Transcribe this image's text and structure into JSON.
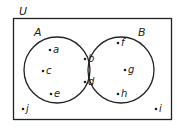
{
  "diagram": {
    "type": "venn",
    "universe_label": "U",
    "sets": [
      {
        "label": "A",
        "elements_only": [
          "a",
          "c",
          "e"
        ]
      },
      {
        "label": "B",
        "elements_only": [
          "f",
          "g",
          "h"
        ]
      }
    ],
    "intersection": [
      "b",
      "d"
    ],
    "outside": [
      "j",
      "i"
    ],
    "points": [
      {
        "label": "a",
        "x": 50,
        "y": 50
      },
      {
        "label": "c",
        "x": 43,
        "y": 71
      },
      {
        "label": "e",
        "x": 51,
        "y": 94
      },
      {
        "label": "b",
        "x": 85,
        "y": 59
      },
      {
        "label": "d",
        "x": 85,
        "y": 82
      },
      {
        "label": "f",
        "x": 118,
        "y": 43
      },
      {
        "label": "g",
        "x": 125,
        "y": 70
      },
      {
        "label": "h",
        "x": 118,
        "y": 94
      },
      {
        "label": "j",
        "x": 23,
        "y": 109
      },
      {
        "label": "i",
        "x": 156,
        "y": 109
      }
    ],
    "colors": {
      "stroke": "#222222",
      "background": "#ffffff"
    }
  }
}
